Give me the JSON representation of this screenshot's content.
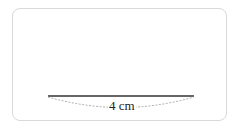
{
  "diagram": {
    "segment": {
      "length_label": "4 cm",
      "line_color": "#333333",
      "dash_color": "#999999"
    }
  }
}
